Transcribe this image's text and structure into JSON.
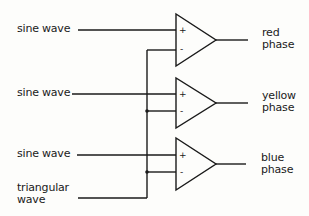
{
  "diagram": {
    "inputs": [
      {
        "label": "sine wave"
      },
      {
        "label": "sine wave"
      },
      {
        "label": "sine wave"
      },
      {
        "label_line1": "triangular",
        "label_line2": "wave"
      }
    ],
    "comparators": [
      {
        "plus": "+",
        "minus": "-",
        "output_line1": "red",
        "output_line2": "phase"
      },
      {
        "plus": "+",
        "minus": "-",
        "output_line1": "yellow",
        "output_line2": "phase"
      },
      {
        "plus": "+",
        "minus": "-",
        "output_line1": "blue",
        "output_line2": "phase"
      }
    ]
  }
}
